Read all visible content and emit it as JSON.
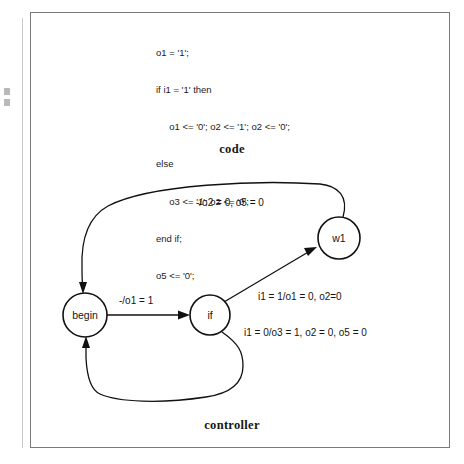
{
  "figure": {
    "code_caption": "code",
    "controller_caption": "controller"
  },
  "code": {
    "lines": [
      "o1 = '1';",
      "if i1 = '1' then",
      "     o1 <= '0'; o2 <= '1'; o2 <= '0';",
      "else",
      "     o3 <= '1'; o2 <= '0';",
      "end if;",
      "o5 <= '0';"
    ]
  },
  "controller": {
    "states": [
      {
        "id": "begin",
        "label": "begin",
        "cx": 85,
        "cy": 315,
        "r": 22
      },
      {
        "id": "if",
        "label": "if",
        "cx": 210,
        "cy": 315,
        "r": 20
      },
      {
        "id": "w1",
        "label": "w1",
        "cx": 339,
        "cy": 238,
        "r": 21
      }
    ],
    "transitions": [
      {
        "id": "begin-to-if",
        "from": "begin",
        "to": "if",
        "label": "-/o1 = 1",
        "label_x": 148,
        "label_y": 304
      },
      {
        "id": "if-to-w1",
        "from": "if",
        "to": "w1",
        "label": "i1 = 1/o1 = 0, o2=0",
        "label_x": 264,
        "label_y": 297
      },
      {
        "id": "if-to-begin",
        "from": "if",
        "to": "begin",
        "label": "i1 = 0/o3 = 1, o2 = 0, o5 = 0",
        "label_x": 244,
        "label_y": 333
      },
      {
        "id": "w1-to-begin",
        "from": "w1",
        "to": "begin",
        "label": "-/o2 = 0, o5 = 0",
        "label_x": 196,
        "label_y": 206
      }
    ]
  },
  "colors": {
    "ink": "#111111",
    "frame": "#7a7a7a",
    "page": "#ffffff"
  }
}
